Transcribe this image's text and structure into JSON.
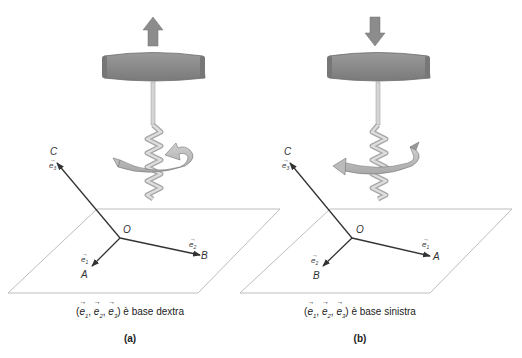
{
  "figure": {
    "colors": {
      "handle": "#8a8a8a",
      "handle_dark": "#6e6e6e",
      "arrow_fill": "#8c8c8c",
      "spiral": "#c8c8c8",
      "rotation_band": "#b4b4b4",
      "axis": "#333333",
      "plane": "#bdbdbd"
    },
    "panels": [
      {
        "id": "a",
        "push_direction": "up",
        "rotation": "counterclockwise-from-above",
        "labels": {
          "C": "C",
          "O": "O",
          "B": "B",
          "A": "A",
          "e_C": "e3",
          "e_B": "e2",
          "e_A": "e1"
        },
        "caption": {
          "tuple_open": "(",
          "e1": "e",
          "e1_sub": "1",
          "e2": "e",
          "e2_sub": "2",
          "e3": "e",
          "e3_sub": "3",
          "sep": ", ",
          "tuple_close": ")",
          "text": " è base dextra"
        },
        "sub_label": "(a)"
      },
      {
        "id": "b",
        "push_direction": "down",
        "rotation": "clockwise-from-above",
        "labels": {
          "C": "C",
          "O": "O",
          "B": "B",
          "A": "A",
          "e_C": "e3",
          "e_B": "e2",
          "e_A": "e1"
        },
        "caption": {
          "tuple_open": "(",
          "e1": "e",
          "e1_sub": "1",
          "e2": "e",
          "e2_sub": "2",
          "e3": "e",
          "e3_sub": "3",
          "sep": ", ",
          "tuple_close": ")",
          "text": " è base sinistra"
        },
        "sub_label": "(b)"
      }
    ]
  }
}
